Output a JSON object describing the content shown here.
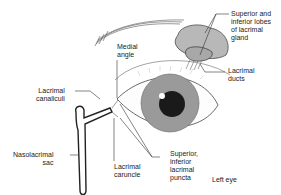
{
  "side_label": "Left eye",
  "labels": {
    "lacrimal_gland": "Superior and\ninferior lobes\nof lacrimal\ngland",
    "lacrimal_ducts": "Lacrimal\nducts",
    "medial_angle": "Medial\nangle",
    "lacrimal_canaliculi": "Lacrimal\ncanaliculi",
    "nasolacrimal_sac": "Nasolacrimal\nsac",
    "lacrimal_caruncle": "Lacrimal\ncaruncle",
    "lacrimal_puncta": "Superior,\ninferior\nlacrimal\npuncta"
  },
  "colors": {
    "iris": "#9a9a9a",
    "pupil": "#1a1a1a",
    "gland": "#b8b8b8",
    "line": "#333333"
  }
}
